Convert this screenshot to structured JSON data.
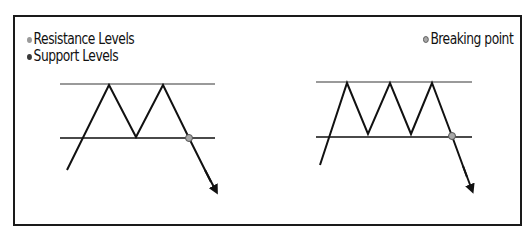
{
  "legend": {
    "items": [
      {
        "label": "Resistance Levels",
        "color": "#9a9a9a"
      },
      {
        "label": "Support Levels",
        "color": "#3a3a3a"
      }
    ],
    "breaking_point": {
      "label": "Breaking point",
      "color": "#a8a8a8"
    }
  },
  "colors": {
    "resistance_line": "#9a9a9a",
    "support_line": "#4a4a4a",
    "price_line": "#111111",
    "breakpoint_fill": "#a8a8a8",
    "frame": "#1a1a1a"
  },
  "patterns": [
    {
      "name": "double-top",
      "peaks": 2
    },
    {
      "name": "triple-top",
      "peaks": 3
    }
  ]
}
